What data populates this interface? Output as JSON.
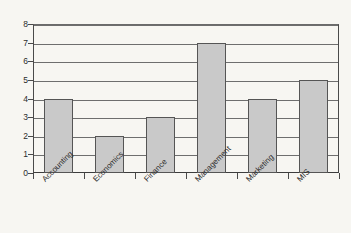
{
  "chart_data": {
    "type": "bar",
    "title": "",
    "subtitle": "",
    "xlabel": "",
    "ylabel": "",
    "categories": [
      "Accounting",
      "Economics",
      "Finance",
      "Management",
      "Marketing",
      "MIS"
    ],
    "values": [
      4,
      2,
      3,
      7,
      4,
      5
    ],
    "series": [
      {
        "name": "",
        "values": [
          4,
          2,
          3,
          7,
          4,
          5
        ]
      }
    ],
    "ylim": [
      0,
      8
    ],
    "ytick_labels": [
      "0",
      "1",
      "2",
      "3",
      "4",
      "5",
      "6",
      "7",
      "8"
    ],
    "ytick_values": [
      0,
      1,
      2,
      3,
      4,
      5,
      6,
      7,
      8
    ],
    "grid": true,
    "grid_axis": "y",
    "legend": false,
    "legend_position": "none",
    "annotations": [],
    "colors": {
      "bar_fill": "#c9c9c9",
      "bar_border": "#555555",
      "gridline": "#6e6e6e",
      "axis": "#4a4a4a",
      "background": "#f7f6f2",
      "text": "#2b2b2b"
    }
  }
}
